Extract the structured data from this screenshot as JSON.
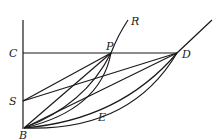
{
  "diagram": {
    "type": "geometry",
    "labels": {
      "C": "C",
      "S": "S",
      "B": "B",
      "P": "P",
      "R": "R",
      "D": "D",
      "E": "E"
    },
    "points": {
      "C": [
        23,
        53
      ],
      "S": [
        23,
        101
      ],
      "B": [
        24,
        128
      ],
      "P": [
        111,
        53
      ],
      "D": [
        177,
        53
      ],
      "R_end": [
        128,
        20
      ],
      "curve_end": [
        212,
        20
      ]
    }
  }
}
